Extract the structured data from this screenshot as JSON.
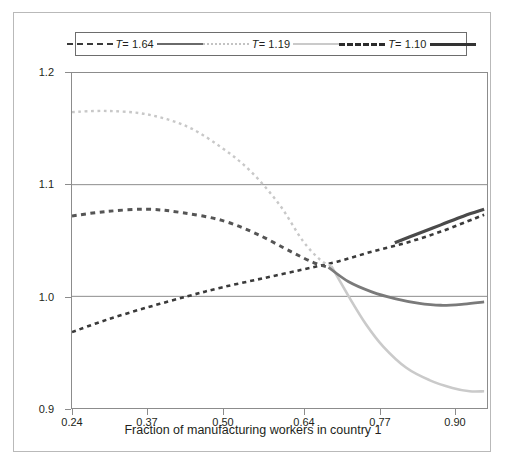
{
  "figure": {
    "border_color": "#b9b9b9",
    "background": "#ffffff"
  },
  "legend": {
    "position": "top-center",
    "entries": [
      {
        "label_prefix": "T",
        "label_value": "= 1.64",
        "dash_color": "#3a3a3a",
        "solid_color": "#6a6a6a"
      },
      {
        "label_prefix": "T",
        "label_value": "= 1.19",
        "dash_color": "#c3c3c3",
        "solid_color": "#cacaca"
      },
      {
        "label_prefix": "T",
        "label_value": "= 1.10",
        "dash_color": "#2b2b2b",
        "solid_color": "#333333"
      }
    ]
  },
  "axes": {
    "xlabel": "Fraction of manufacturing workers in country 1",
    "ylabel_text": "Relative real wage (W1/W2)",
    "ylabel_main": "Relative real wage (",
    "ylabel_w1": "W",
    "ylabel_sub1": "1",
    "ylabel_slash": "/",
    "ylabel_w2": "W",
    "ylabel_sub2": "2",
    "ylabel_close": ")",
    "xticks": [
      "0.24",
      "0.37",
      "0.50",
      "0.64",
      "0.77",
      "0.90"
    ],
    "yticks": [
      "0.9",
      "1.0",
      "1.1",
      "1.2"
    ],
    "xlim": [
      0.24,
      0.96
    ],
    "ylim": [
      0.9,
      1.2
    ],
    "gridlines_y": [
      1.0,
      1.1
    ],
    "grid_color": "#8c8c8c"
  },
  "chart_data": {
    "type": "line",
    "title": "",
    "xlabel": "Fraction of manufacturing workers in country 1",
    "ylabel": "Relative real wage (W1/W2)",
    "xlim": [
      0.24,
      0.96
    ],
    "ylim": [
      0.9,
      1.2
    ],
    "xticks": [
      0.24,
      0.37,
      0.5,
      0.64,
      0.77,
      0.9
    ],
    "yticks": [
      0.9,
      1.0,
      1.1,
      1.2
    ],
    "grid": "horizontal-gridlines-at-1.0-and-1.1",
    "legend_position": "top",
    "series": [
      {
        "name": "T = 1.64",
        "style": "dashed",
        "color": "#3a3a3a",
        "width": 2.6,
        "x": [
          0.24,
          0.3,
          0.37,
          0.44,
          0.5,
          0.57,
          0.64,
          0.7,
          0.76,
          0.82,
          0.88,
          0.94,
          0.955
        ],
        "y": [
          0.968,
          0.979,
          0.99,
          1.0,
          1.008,
          1.016,
          1.024,
          1.031,
          1.04,
          1.048,
          1.058,
          1.07,
          1.073
        ]
      },
      {
        "name": "T = 1.19 (upper, light dotted branch)",
        "style": "dotted",
        "color": "#c8c8c8",
        "width": 2.4,
        "x": [
          0.24,
          0.3,
          0.37,
          0.44,
          0.5,
          0.55,
          0.6,
          0.64,
          0.67,
          0.69
        ],
        "y": [
          1.165,
          1.166,
          1.163,
          1.152,
          1.133,
          1.112,
          1.082,
          1.05,
          1.033,
          1.027
        ]
      },
      {
        "name": "T = 1.19 (lower, light solid branch)",
        "style": "solid",
        "color": "#cacaca",
        "width": 2.6,
        "x": [
          0.69,
          0.72,
          0.75,
          0.78,
          0.82,
          0.86,
          0.9,
          0.93,
          0.955
        ],
        "y": [
          1.027,
          1.0,
          0.975,
          0.955,
          0.936,
          0.925,
          0.918,
          0.915,
          0.915
        ]
      },
      {
        "name": "T = 1.10 (dashed medium branch)",
        "style": "dashed",
        "color": "#555555",
        "width": 3.0,
        "x": [
          0.24,
          0.3,
          0.37,
          0.43,
          0.5,
          0.56,
          0.62,
          0.66,
          0.685
        ],
        "y": [
          1.072,
          1.076,
          1.078,
          1.075,
          1.068,
          1.056,
          1.04,
          1.03,
          1.026
        ]
      },
      {
        "name": "T = 1.10 (solid medium lower branch)",
        "style": "solid",
        "color": "#7a7a7a",
        "width": 2.8,
        "x": [
          0.685,
          0.72,
          0.76,
          0.8,
          0.84,
          0.88,
          0.92,
          0.955
        ],
        "y": [
          1.026,
          1.013,
          1.004,
          0.998,
          0.994,
          0.992,
          0.993,
          0.995
        ]
      },
      {
        "name": "T = 1.64 (upper dark solid branch)",
        "style": "solid",
        "color": "#4a4a4a",
        "width": 3.2,
        "x": [
          0.8,
          0.84,
          0.88,
          0.92,
          0.955
        ],
        "y": [
          1.048,
          1.056,
          1.064,
          1.072,
          1.078
        ]
      }
    ]
  }
}
